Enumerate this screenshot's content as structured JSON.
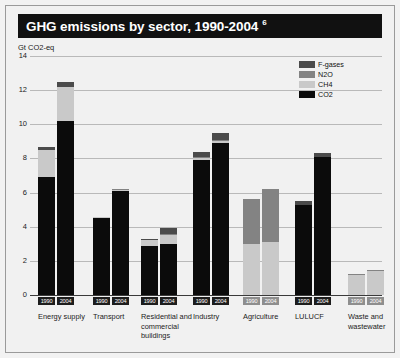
{
  "header": {
    "title": "GHG emissions by sector, 1990-2004",
    "footnote_marker": "6"
  },
  "axis": {
    "unit_label": "Gt CO2-eq",
    "y_ticks": [
      "14",
      "12",
      "10",
      "8",
      "6",
      "4",
      "2",
      "0"
    ]
  },
  "legend": {
    "items": [
      {
        "label": "F-gases",
        "color": "#4b4b4b"
      },
      {
        "label": "N2O",
        "color": "#838383"
      },
      {
        "label": "CH4",
        "color": "#c9c9c9"
      },
      {
        "label": "CO2",
        "color": "#0b0b0b"
      }
    ]
  },
  "chart_data": {
    "type": "bar",
    "title": "GHG emissions by sector, 1990-2004",
    "xlabel": "",
    "ylabel": "Gt CO2-eq",
    "ylim": [
      0,
      14
    ],
    "ytick_step": 2,
    "grid": true,
    "stacked": true,
    "legend_position": "top-right",
    "categories": [
      "Energy supply",
      "Transport",
      "Residential and commercial buildings",
      "Industry",
      "Agriculture",
      "LULUCF",
      "Waste and wastewater"
    ],
    "sub_categories": [
      "1990",
      "2004"
    ],
    "series": [
      {
        "name": "CO2",
        "color": "#0b0b0b",
        "values_1990": [
          6.9,
          4.5,
          2.9,
          7.9,
          0.0,
          5.3,
          0.0
        ],
        "values_2004": [
          10.2,
          6.1,
          3.0,
          8.9,
          0.0,
          8.1,
          0.0
        ]
      },
      {
        "name": "CH4",
        "color": "#c9c9c9",
        "values_1990": [
          1.6,
          0.05,
          0.3,
          0.1,
          3.0,
          0.0,
          1.2
        ],
        "values_2004": [
          2.0,
          0.05,
          0.5,
          0.1,
          3.1,
          0.0,
          1.4
        ]
      },
      {
        "name": "N2O",
        "color": "#838383",
        "values_1990": [
          0.0,
          0.05,
          0.05,
          0.1,
          2.6,
          0.0,
          0.05
        ],
        "values_2004": [
          0.0,
          0.05,
          0.05,
          0.1,
          3.1,
          0.0,
          0.05
        ]
      },
      {
        "name": "F-gases",
        "color": "#4b4b4b",
        "values_1990": [
          0.2,
          0.0,
          0.05,
          0.3,
          0.0,
          0.2,
          0.0
        ],
        "values_2004": [
          0.3,
          0.0,
          0.35,
          0.4,
          0.0,
          0.2,
          0.0
        ]
      }
    ],
    "totals_1990": [
      8.7,
      4.6,
      3.3,
      8.4,
      5.6,
      5.5,
      1.25
    ],
    "totals_2004": [
      12.5,
      6.2,
      3.9,
      9.5,
      6.2,
      8.3,
      1.45
    ]
  }
}
